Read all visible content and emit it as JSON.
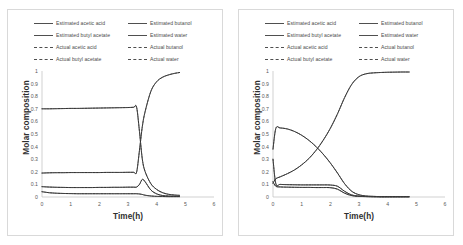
{
  "figure": {
    "panel_count": 2
  },
  "legend": {
    "items": [
      {
        "label": "Estimated acetic acid",
        "style": "solid"
      },
      {
        "label": "Estimated butanol",
        "style": "solid"
      },
      {
        "label": "Estimated butyl acetate",
        "style": "solid"
      },
      {
        "label": "Estimated water",
        "style": "solid"
      },
      {
        "label": "Actual acetic acid",
        "style": "dashed"
      },
      {
        "label": "Actual butanol",
        "style": "dashed"
      },
      {
        "label": "Actual butyl acetate",
        "style": "dashed"
      },
      {
        "label": "Actual water",
        "style": "dashed"
      }
    ]
  },
  "axes": {
    "ylabel": "Molar composition",
    "xlabel": "Time(h)",
    "yticks": [
      "0",
      "0.1",
      "0.2",
      "0.3",
      "0.4",
      "0.5",
      "0.6",
      "0.7",
      "0.8",
      "0.9",
      "1"
    ],
    "xticks": [
      "0",
      "1",
      "2",
      "3",
      "4",
      "5",
      "6"
    ]
  },
  "chart_data": [
    {
      "type": "line",
      "title": "",
      "subtitle": "Left panel",
      "xlabel": "Time(h)",
      "ylabel": "Molar composition",
      "xlim": [
        0,
        6
      ],
      "ylim": [
        0,
        1
      ],
      "xticks": [
        0,
        1,
        2,
        3,
        4,
        5,
        6
      ],
      "yticks": [
        0,
        0.1,
        0.2,
        0.3,
        0.4,
        0.5,
        0.6,
        0.7,
        0.8,
        0.9,
        1
      ],
      "grid": false,
      "legend_position": "top",
      "x": [
        0,
        0.25,
        0.5,
        0.75,
        1,
        1.25,
        1.5,
        1.75,
        2,
        2.25,
        2.5,
        2.75,
        3,
        3.2,
        3.3,
        3.4,
        3.5,
        3.6,
        3.8,
        4,
        4.2,
        4.4,
        4.6,
        4.8
      ],
      "series": [
        {
          "name": "Estimated acetic acid",
          "style": "solid",
          "values": [
            0.082,
            0.079,
            0.077,
            0.076,
            0.075,
            0.075,
            0.075,
            0.075,
            0.076,
            0.076,
            0.077,
            0.077,
            0.078,
            0.078,
            0.079,
            0.1,
            0.14,
            0.12,
            0.055,
            0.025,
            0.012,
            0.008,
            0.006,
            0.005
          ]
        },
        {
          "name": "Actual acetic acid",
          "style": "dashed",
          "values": [
            0.082,
            0.079,
            0.077,
            0.076,
            0.075,
            0.075,
            0.075,
            0.075,
            0.076,
            0.076,
            0.077,
            0.077,
            0.078,
            0.078,
            0.079,
            0.1,
            0.14,
            0.12,
            0.055,
            0.025,
            0.012,
            0.008,
            0.006,
            0.005
          ]
        },
        {
          "name": "Estimated butanol",
          "style": "solid",
          "values": [
            0.042,
            0.034,
            0.03,
            0.028,
            0.027,
            0.026,
            0.026,
            0.026,
            0.026,
            0.026,
            0.026,
            0.026,
            0.026,
            0.026,
            0.026,
            0.024,
            0.02,
            0.014,
            0.008,
            0.005,
            0.004,
            0.003,
            0.003,
            0.003
          ]
        },
        {
          "name": "Actual butanol",
          "style": "dashed",
          "values": [
            0.042,
            0.034,
            0.03,
            0.028,
            0.027,
            0.026,
            0.026,
            0.026,
            0.026,
            0.026,
            0.026,
            0.026,
            0.026,
            0.026,
            0.026,
            0.024,
            0.02,
            0.014,
            0.008,
            0.005,
            0.004,
            0.003,
            0.003,
            0.003
          ]
        },
        {
          "name": "Estimated butyl acetate",
          "style": "solid",
          "values": [
            0.7,
            0.7,
            0.701,
            0.702,
            0.703,
            0.703,
            0.704,
            0.705,
            0.706,
            0.707,
            0.708,
            0.709,
            0.71,
            0.712,
            0.713,
            0.52,
            0.3,
            0.2,
            0.105,
            0.06,
            0.035,
            0.022,
            0.016,
            0.013
          ]
        },
        {
          "name": "Actual butyl acetate",
          "style": "dashed",
          "values": [
            0.7,
            0.7,
            0.701,
            0.702,
            0.703,
            0.703,
            0.704,
            0.705,
            0.706,
            0.707,
            0.708,
            0.709,
            0.71,
            0.712,
            0.713,
            0.52,
            0.3,
            0.2,
            0.105,
            0.06,
            0.035,
            0.022,
            0.016,
            0.013
          ]
        },
        {
          "name": "Estimated water",
          "style": "solid",
          "values": [
            0.19,
            0.192,
            0.193,
            0.193,
            0.194,
            0.194,
            0.194,
            0.194,
            0.194,
            0.195,
            0.195,
            0.195,
            0.196,
            0.196,
            0.197,
            0.37,
            0.56,
            0.68,
            0.84,
            0.915,
            0.95,
            0.968,
            0.98,
            0.988
          ]
        },
        {
          "name": "Actual water",
          "style": "dashed",
          "values": [
            0.19,
            0.192,
            0.193,
            0.193,
            0.194,
            0.194,
            0.194,
            0.194,
            0.194,
            0.195,
            0.195,
            0.195,
            0.196,
            0.196,
            0.197,
            0.37,
            0.56,
            0.68,
            0.84,
            0.915,
            0.95,
            0.968,
            0.98,
            0.988
          ]
        }
      ]
    },
    {
      "type": "line",
      "title": "",
      "subtitle": "Right panel",
      "xlabel": "Time(h)",
      "ylabel": "Molar composition",
      "xlim": [
        0,
        6
      ],
      "ylim": [
        0,
        1
      ],
      "xticks": [
        0,
        1,
        2,
        3,
        4,
        5,
        6
      ],
      "yticks": [
        0,
        0.1,
        0.2,
        0.3,
        0.4,
        0.5,
        0.6,
        0.7,
        0.8,
        0.9,
        1
      ],
      "grid": false,
      "legend_position": "top",
      "x": [
        0,
        0.1,
        0.25,
        0.5,
        0.75,
        1,
        1.25,
        1.5,
        1.75,
        2,
        2.25,
        2.5,
        2.75,
        3,
        3.25,
        3.5,
        3.75,
        4,
        4.25,
        4.5,
        4.75
      ],
      "series": [
        {
          "name": "Estimated acetic acid",
          "style": "solid",
          "values": [
            0.3,
            0.105,
            0.1,
            0.098,
            0.097,
            0.096,
            0.096,
            0.096,
            0.096,
            0.095,
            0.085,
            0.045,
            0.016,
            0.007,
            0.004,
            0.003,
            0.002,
            0.002,
            0.002,
            0.002,
            0.002
          ]
        },
        {
          "name": "Actual acetic acid",
          "style": "dashed",
          "values": [
            0.3,
            0.105,
            0.1,
            0.098,
            0.097,
            0.096,
            0.096,
            0.096,
            0.096,
            0.095,
            0.085,
            0.045,
            0.016,
            0.007,
            0.004,
            0.003,
            0.002,
            0.002,
            0.002,
            0.002,
            0.002
          ]
        },
        {
          "name": "Estimated butanol",
          "style": "solid",
          "values": [
            0.12,
            0.085,
            0.08,
            0.078,
            0.077,
            0.076,
            0.076,
            0.075,
            0.075,
            0.074,
            0.062,
            0.03,
            0.011,
            0.005,
            0.003,
            0.002,
            0.002,
            0.002,
            0.002,
            0.002,
            0.002
          ]
        },
        {
          "name": "Actual butanol",
          "style": "dashed",
          "values": [
            0.12,
            0.085,
            0.08,
            0.078,
            0.077,
            0.076,
            0.076,
            0.075,
            0.075,
            0.074,
            0.062,
            0.03,
            0.011,
            0.005,
            0.003,
            0.002,
            0.002,
            0.002,
            0.002,
            0.002,
            0.002
          ]
        },
        {
          "name": "Estimated butyl acetate",
          "style": "solid",
          "values": [
            0.38,
            0.545,
            0.548,
            0.54,
            0.52,
            0.49,
            0.45,
            0.4,
            0.34,
            0.27,
            0.19,
            0.105,
            0.045,
            0.018,
            0.008,
            0.005,
            0.003,
            0.003,
            0.003,
            0.003,
            0.003
          ]
        },
        {
          "name": "Actual butyl acetate",
          "style": "dashed",
          "values": [
            0.38,
            0.545,
            0.548,
            0.54,
            0.52,
            0.49,
            0.45,
            0.4,
            0.34,
            0.27,
            0.19,
            0.105,
            0.045,
            0.018,
            0.008,
            0.005,
            0.003,
            0.003,
            0.003,
            0.003,
            0.003
          ]
        },
        {
          "name": "Estimated water",
          "style": "solid",
          "values": [
            0.11,
            0.145,
            0.16,
            0.185,
            0.215,
            0.255,
            0.305,
            0.37,
            0.45,
            0.545,
            0.66,
            0.79,
            0.895,
            0.955,
            0.978,
            0.985,
            0.988,
            0.99,
            0.991,
            0.992,
            0.992
          ]
        },
        {
          "name": "Actual water",
          "style": "dashed",
          "values": [
            0.11,
            0.145,
            0.16,
            0.185,
            0.215,
            0.255,
            0.305,
            0.37,
            0.45,
            0.545,
            0.66,
            0.79,
            0.895,
            0.955,
            0.978,
            0.985,
            0.988,
            0.99,
            0.991,
            0.992,
            0.992
          ]
        }
      ]
    }
  ]
}
